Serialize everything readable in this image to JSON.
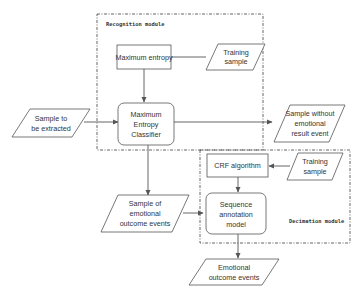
{
  "diagram": {
    "type": "flowchart",
    "modules": {
      "recognition": {
        "label": "Recognition module"
      },
      "decision": {
        "label": "Decimation module"
      }
    },
    "nodes": {
      "max_entropy": {
        "label": "Maximum entropy",
        "shape": "rectangle"
      },
      "training_sample_1": {
        "line1": "Training",
        "line2": "sample",
        "shape": "parallelogram"
      },
      "sample_to_extract": {
        "line1": "Sample to",
        "line2": "be extracted",
        "shape": "parallelogram"
      },
      "me_classifier": {
        "line1": "Maximum",
        "line2": "Entropy",
        "line3": "Classifier",
        "shape": "rounded-rectangle"
      },
      "sample_without": {
        "line1": "Sample without",
        "line2": "emotional",
        "line3": "result event",
        "shape": "parallelogram"
      },
      "crf": {
        "label": "CRF algorithm",
        "shape": "rectangle"
      },
      "training_sample_2": {
        "line1": "Training",
        "line2": "sample",
        "shape": "parallelogram"
      },
      "sample_of_emotional": {
        "line1": "Sample of",
        "line2": "emotional",
        "line3": "outcome events",
        "shape": "parallelogram"
      },
      "sequence_model": {
        "line1": "Sequence",
        "line2": "annotation",
        "line3": "model",
        "shape": "rounded-rectangle"
      },
      "emotional_events": {
        "line1": "Emotional",
        "line2": "outcome events",
        "shape": "parallelogram"
      }
    },
    "edges": [
      {
        "from": "training_sample_1",
        "to": "max_entropy",
        "arrow": false
      },
      {
        "from": "max_entropy",
        "to": "me_classifier",
        "arrow": true
      },
      {
        "from": "sample_to_extract",
        "to": "me_classifier",
        "arrow": true
      },
      {
        "from": "me_classifier",
        "to": "sample_without",
        "arrow": true
      },
      {
        "from": "me_classifier",
        "to": "sample_of_emotional",
        "arrow": true
      },
      {
        "from": "training_sample_2",
        "to": "crf",
        "arrow": true
      },
      {
        "from": "crf",
        "to": "sequence_model",
        "arrow": true
      },
      {
        "from": "sample_of_emotional",
        "to": "sequence_model",
        "arrow": true
      },
      {
        "from": "sequence_model",
        "to": "emotional_events",
        "arrow": true
      }
    ]
  }
}
